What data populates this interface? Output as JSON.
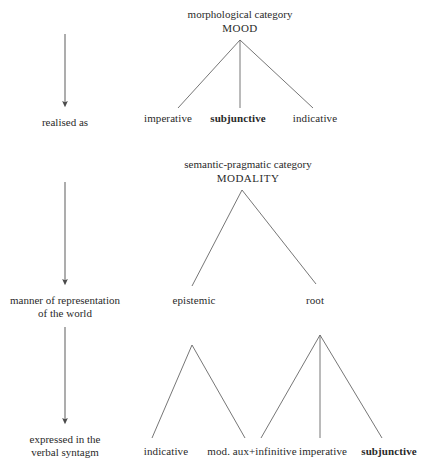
{
  "diagram": {
    "line_color": "#555555",
    "text_color": "#2a2a2a",
    "stage_arrows": [
      {
        "name": "arrow-realised-as",
        "x": 65,
        "y1": 34,
        "y2": 110
      },
      {
        "name": "arrow-manner-of-representation",
        "x": 65,
        "y1": 182,
        "y2": 288
      },
      {
        "name": "arrow-expressed-in-verbal-syntagm",
        "x": 65,
        "y1": 327,
        "y2": 427
      }
    ],
    "stage_labels": [
      {
        "name": "stage-label-realised-as",
        "text": "realised as",
        "x": 65,
        "y": 117
      },
      {
        "name": "stage-label-manner",
        "text": "manner of representation\nof the world",
        "x": 65,
        "y": 295
      },
      {
        "name": "stage-label-expressed",
        "text": "expressed in the\nverbal syntagm",
        "x": 65,
        "y": 434
      }
    ],
    "tree_mood": {
      "category_label": "morphological category",
      "node_label": "MOOD",
      "head_x": 240,
      "head_y": 8,
      "apex": {
        "x": 240,
        "y": 40
      },
      "children": [
        {
          "name": "imperative",
          "label": "imperative",
          "x": 168,
          "y": 113,
          "bold": false
        },
        {
          "name": "subjunctive",
          "label": "subjunctive",
          "x": 238,
          "y": 113,
          "bold": true
        },
        {
          "name": "indicative",
          "label": "indicative",
          "x": 315,
          "y": 113,
          "bold": false
        }
      ],
      "branch_ends": [
        {
          "x": 178,
          "y": 108
        },
        {
          "x": 240,
          "y": 108
        },
        {
          "x": 313,
          "y": 108
        }
      ]
    },
    "tree_modality": {
      "category_label": "semantic-pragmatic category",
      "node_label": "MODALITY",
      "head_x": 248,
      "head_y": 158,
      "apex": {
        "x": 242,
        "y": 190
      },
      "children": [
        {
          "name": "epistemic",
          "label": "epistemic",
          "x": 194,
          "y": 295,
          "bold": false
        },
        {
          "name": "root",
          "label": "root",
          "x": 315,
          "y": 295,
          "bold": false
        }
      ],
      "branch_ends": [
        {
          "x": 192,
          "y": 286
        },
        {
          "x": 316,
          "y": 284
        }
      ]
    },
    "tree_epistemic": {
      "parent": "epistemic",
      "apex": {
        "x": 192,
        "y": 345
      },
      "children": [
        {
          "name": "indicative-2",
          "label": "indicative",
          "x": 166,
          "y": 446,
          "bold": false
        },
        {
          "name": "mod-aux-infinitive",
          "label": "mod. aux+infinitive",
          "x": 252,
          "y": 446,
          "bold": false
        }
      ],
      "branch_ends": [
        {
          "x": 152,
          "y": 438
        },
        {
          "x": 245,
          "y": 438
        }
      ]
    },
    "tree_root": {
      "parent": "root",
      "apex": {
        "x": 320,
        "y": 335
      },
      "children": [
        {
          "name": "imperative-2",
          "label": "imperative",
          "x": 323,
          "y": 446,
          "bold": false
        },
        {
          "name": "subjunctive-2",
          "label": "subjunctive",
          "x": 389,
          "y": 446,
          "bold": true
        }
      ],
      "branch_ends": [
        {
          "x": 261,
          "y": 438
        },
        {
          "x": 320,
          "y": 438
        },
        {
          "x": 382,
          "y": 438
        }
      ]
    }
  }
}
